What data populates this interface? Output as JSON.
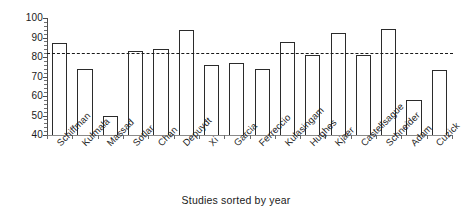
{
  "chart_data": {
    "type": "bar",
    "title": "",
    "xlabel": "Studies sorted by year",
    "ylabel": "",
    "ylim": [
      40,
      100
    ],
    "ytick_step": 10,
    "yticks": [
      40,
      50,
      60,
      70,
      80,
      90,
      100
    ],
    "ytick_labels": [
      "40",
      "50",
      "60",
      "70",
      "80",
      "90",
      "100"
    ],
    "minor_tick_step": 2,
    "grid": false,
    "legend": null,
    "bar_style": {
      "fill": "#ffffff",
      "edge": "#2b2b2b"
    },
    "reference_line": {
      "value": 82,
      "style": "dashed",
      "color": "#1a1a1a",
      "label": ""
    },
    "categories": [
      "Schiffman",
      "Kulmala",
      "Massad",
      "Sotlar",
      "Chan",
      "Depuydt",
      "Xi",
      "Garcia",
      "Ferreccio",
      "Kulasingam",
      "Hughes",
      "Kjaer",
      "Castellsague",
      "Schneider",
      "Adam",
      "Cuzick"
    ],
    "values": [
      87,
      74,
      50,
      83,
      84,
      94,
      76,
      77,
      74,
      87.5,
      81,
      92.5,
      81,
      94.5,
      58,
      73.5
    ]
  }
}
